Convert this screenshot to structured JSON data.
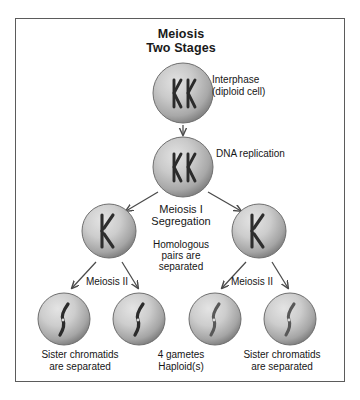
{
  "title": {
    "line1": "Meiosis",
    "line2": "Two Stages"
  },
  "labels": {
    "interphase": "Interphase\n(diploid cell)",
    "dna_replication": "DNA replication",
    "meiosis_one_heading": "Meiosis I\nSegregation",
    "meiosis_one_sub": "Homologous\npairs are\nseparated",
    "meiosis_two_left": "Meiosis II",
    "meiosis_two_right": "Meiosis II"
  },
  "captions": {
    "left": "Sister chromatids\nare separated",
    "middle": "4 gametes\nHaploid(s)",
    "right": "Sister chromatids\nare separated"
  },
  "colors": {
    "border": "#5b5b5b",
    "cell_light": "#d8d8d8",
    "cell_mid": "#b9b9b9",
    "cell_dark": "#8f8f8f",
    "cell_rim": "#6f6f6f",
    "chromosome_dark": "#2e2e2e",
    "chromosome_mid": "#555555",
    "arrow": "#4a4a4a",
    "text": "#161616",
    "background": "#ffffff"
  },
  "cells": [
    {
      "id": "interphase-cell",
      "cx": 167,
      "cy": 74,
      "r": 30,
      "contents": "two-homologous-pairs"
    },
    {
      "id": "replication-cell",
      "cx": 167,
      "cy": 148,
      "r": 30,
      "contents": "two-homologous-pairs"
    },
    {
      "id": "meiosis1-cell-left",
      "cx": 93,
      "cy": 212,
      "r": 27,
      "contents": "one-duplicated-chromosome"
    },
    {
      "id": "meiosis1-cell-right",
      "cx": 243,
      "cy": 212,
      "r": 27,
      "contents": "one-duplicated-chromosome"
    },
    {
      "id": "gamete-cell-1",
      "cx": 48,
      "cy": 300,
      "r": 26,
      "contents": "single-chromatid-dark"
    },
    {
      "id": "gamete-cell-2",
      "cx": 123,
      "cy": 300,
      "r": 26,
      "contents": "single-chromatid-dark"
    },
    {
      "id": "gamete-cell-3",
      "cx": 199,
      "cy": 300,
      "r": 26,
      "contents": "single-chromatid-light"
    },
    {
      "id": "gamete-cell-4",
      "cx": 274,
      "cy": 300,
      "r": 26,
      "contents": "single-chromatid-light"
    }
  ],
  "arrows": [
    {
      "id": "arrow-interphase-to-replication",
      "from": "interphase-cell",
      "to": "replication-cell"
    },
    {
      "id": "arrow-replication-to-meiosis1-left",
      "from": "replication-cell",
      "to": "meiosis1-cell-left"
    },
    {
      "id": "arrow-replication-to-meiosis1-right",
      "from": "replication-cell",
      "to": "meiosis1-cell-right"
    },
    {
      "id": "arrow-meiosis1-left-to-gamete-1",
      "from": "meiosis1-cell-left",
      "to": "gamete-cell-1"
    },
    {
      "id": "arrow-meiosis1-left-to-gamete-2",
      "from": "meiosis1-cell-left",
      "to": "gamete-cell-2"
    },
    {
      "id": "arrow-meiosis1-right-to-gamete-3",
      "from": "meiosis1-cell-right",
      "to": "gamete-cell-3"
    },
    {
      "id": "arrow-meiosis1-right-to-gamete-4",
      "from": "meiosis1-cell-right",
      "to": "gamete-cell-4"
    }
  ]
}
